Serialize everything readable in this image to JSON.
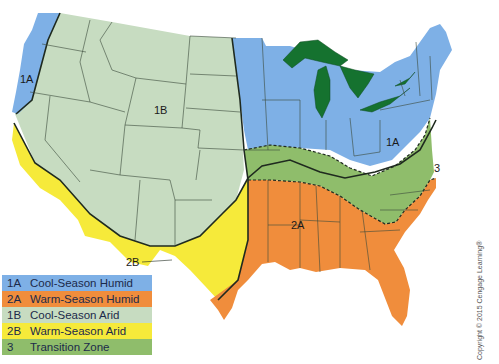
{
  "map": {
    "type": "US turfgrass climate zones map",
    "region_labels": [
      {
        "code": "1A",
        "x": 22,
        "y": 83
      },
      {
        "code": "1B",
        "x": 160,
        "y": 111
      },
      {
        "code": "1A",
        "x": 396,
        "y": 142
      },
      {
        "code": "3",
        "x": 438,
        "y": 171
      },
      {
        "code": "2A",
        "x": 300,
        "y": 225
      },
      {
        "code": "2B",
        "x": 128,
        "y": 263
      }
    ],
    "colors": {
      "cool_season_humid": "#7eb0e6",
      "warm_season_humid": "#f08d3c",
      "cool_season_arid": "#c7dcc1",
      "warm_season_arid": "#f6ea3a",
      "transition_zone": "#8fbd6b",
      "great_lakes": "#15722f",
      "border": "#1f2a1f"
    }
  },
  "legend": {
    "items": [
      {
        "code": "1A",
        "label": "Cool-Season Humid",
        "color": "#7eb0e6"
      },
      {
        "code": "2A",
        "label": "Warm-Season Humid",
        "color": "#f08d3c"
      },
      {
        "code": "1B",
        "label": "Cool-Season Arid",
        "color": "#c7dcc1"
      },
      {
        "code": "2B",
        "label": "Warm-Season Arid",
        "color": "#f6ea3a"
      },
      {
        "code": "3",
        "label": "Transition Zone",
        "color": "#8fbd6b"
      }
    ]
  },
  "copyright": "Copyright © 2015 Cengage Learning®"
}
